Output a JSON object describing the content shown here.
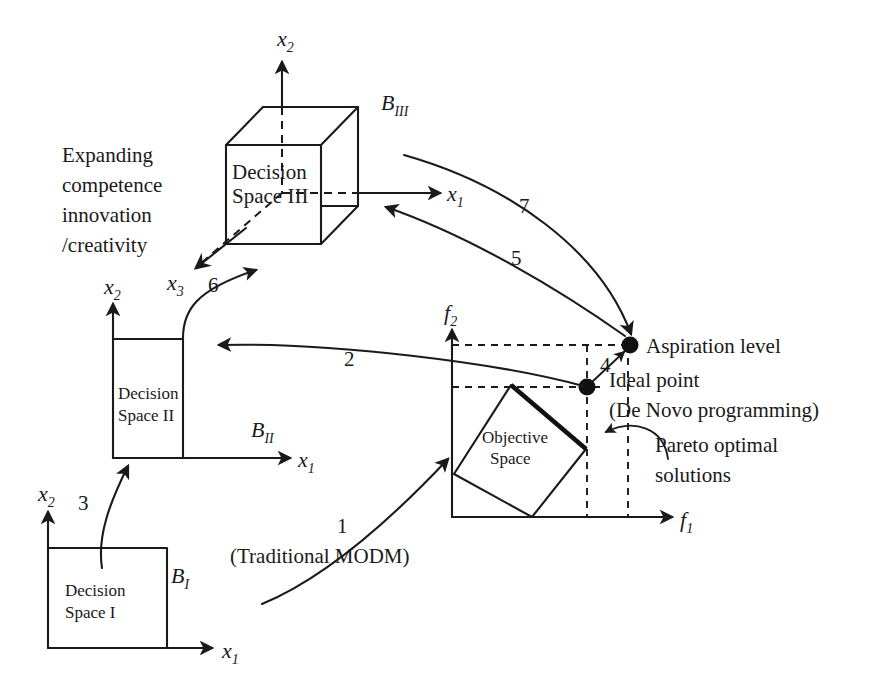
{
  "figure": {
    "type": "concept-diagram",
    "title": "",
    "axes_labels": {
      "x1": "x",
      "x1_sub": "1",
      "x2": "x",
      "x2_sub": "2",
      "x3": "x",
      "x3_sub": "3",
      "f1": "f",
      "f1_sub": "1",
      "f2": "f",
      "f2_sub": "2"
    },
    "boundaries": {
      "b1": "B",
      "b1_sub": "I",
      "b2": "B",
      "b2_sub": "II",
      "b3": "B",
      "b3_sub": "III"
    },
    "spaces": {
      "decision_1_line1": "Decision",
      "decision_1_line2": "Space I",
      "decision_2_line1": "Decision",
      "decision_2_line2": "Space II",
      "decision_3_line1": "Decision",
      "decision_3_line2": "Space III",
      "objective_line1": "Objective",
      "objective_line2": "Space"
    },
    "annotations": {
      "expanding_line1": "Expanding",
      "expanding_line2": "competence",
      "expanding_line3": "innovation",
      "expanding_line4": "/creativity",
      "aspiration_level": "Aspiration level",
      "ideal_point": "Ideal point",
      "de_novo": "(De Novo programming)",
      "pareto_line1": "Pareto optimal",
      "pareto_line2": "solutions",
      "traditional_modm": "(Traditional MODM)"
    },
    "step_numbers": {
      "s1": "1",
      "s2": "2",
      "s3": "3",
      "s4": "4",
      "s5": "5",
      "s6": "6",
      "s7": "7"
    },
    "colors": {
      "ink": "#1a1a1a",
      "background": "#ffffff",
      "marker": "#111111"
    }
  }
}
